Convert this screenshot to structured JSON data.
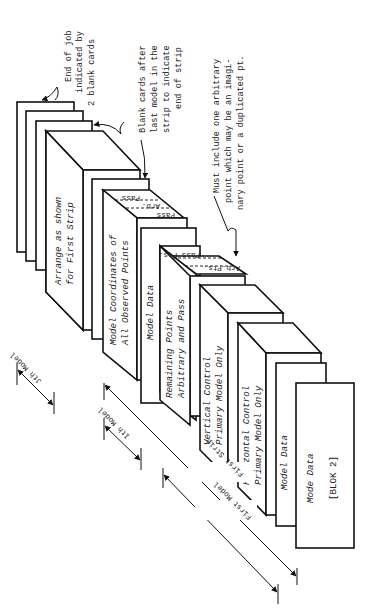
{
  "figure": {
    "orientation": "rotated 90° counter-clockwise (text reads bottom-to-top)",
    "cards_front_to_back": [
      {
        "id": "blok2",
        "lines": [
          "Mode Data",
          "[BLOK 2]"
        ]
      },
      {
        "id": "model-data-1",
        "lines": [
          "Model Data"
        ]
      },
      {
        "id": "horizontal-control",
        "lines": [
          "Horizontal Control",
          "Primary Model Only"
        ]
      },
      {
        "id": "vertical-control",
        "lines": [
          "Vertical Control",
          "Primary Model Only"
        ]
      },
      {
        "id": "remaining-points",
        "lines": [
          "Remaining Points",
          "Arbitrary and Pass"
        ],
        "tabs": [
          "Arb.Pts.",
          "Pass Pts."
        ]
      },
      {
        "id": "model-data-2",
        "lines": [
          "Model Data"
        ]
      },
      {
        "id": "model-coordinates",
        "lines": [
          "Model Coordinates of",
          "All Observed Points"
        ],
        "tabs": [
          "Pass",
          "Arb.",
          "Pass"
        ]
      },
      {
        "id": "blank-card-a",
        "lines": []
      },
      {
        "id": "arrange",
        "lines": [
          "Arrange as shown",
          "for First Strip"
        ]
      },
      {
        "id": "blank-card-b",
        "lines": []
      },
      {
        "id": "blank-card-c",
        "lines": []
      },
      {
        "id": "blank-card-d",
        "lines": []
      }
    ],
    "annotations": {
      "end_of_job": [
        "End of job",
        "indicated by",
        "2 blank cards"
      ],
      "blank_cards": [
        "Blank cards after",
        "last model in the",
        "strip to indicate",
        "end of strip"
      ],
      "arbitrary_point": [
        "Must include one  arbitrary",
        "point which may be an imagi-",
        "nary point or a duplicated pt."
      ]
    },
    "dimensions": {
      "jth_model": "Jth Model",
      "ith_model": "Ith Model",
      "first_strip": "First Strip",
      "first_model": "First Model"
    }
  }
}
